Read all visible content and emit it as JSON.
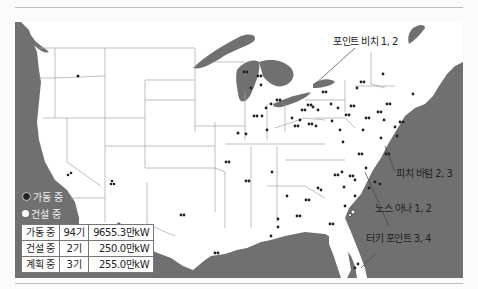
{
  "map": {
    "region": "United States (contiguous)",
    "colors": {
      "ocean": "#707070",
      "land": "#ffffff",
      "border": "#9a9a9a",
      "plant_operating": "#222222",
      "plant_construction": "#ffffff"
    },
    "callouts": [
      {
        "id": "point-beach",
        "label": "포인트 비치 1, 2"
      },
      {
        "id": "peach-bottom",
        "label": "피치 바텀 2, 3"
      },
      {
        "id": "north-anna",
        "label": "노스 아나 1, 2"
      },
      {
        "id": "turkey-point",
        "label": "터키 포인트 3, 4"
      }
    ]
  },
  "legend": {
    "items": [
      {
        "label": "가동 중",
        "symbol": "filled-dot"
      },
      {
        "label": "건설 중",
        "symbol": "open-dot"
      }
    ]
  },
  "stats": {
    "rows": [
      {
        "status": "가동 중",
        "count": "94기",
        "capacity": "9655.3만kW"
      },
      {
        "status": "건설 중",
        "count": "2기",
        "capacity": "250.0만kW"
      },
      {
        "status": "계획 중",
        "count": "3기",
        "capacity": "255.0만kW"
      }
    ]
  }
}
